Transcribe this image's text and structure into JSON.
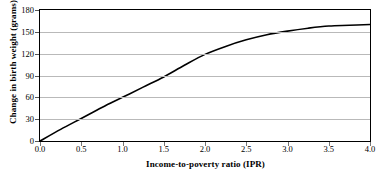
{
  "chart_data": {
    "type": "line",
    "title": "",
    "xlabel": "Income-to-poverty ratio (IPR)",
    "ylabel": "Change in birth weight (grams)",
    "xlim": [
      0.0,
      4.0
    ],
    "ylim": [
      0,
      180
    ],
    "xticks": [
      "0.0",
      "0.5",
      "1.0",
      "1.5",
      "2.0",
      "2.5",
      "3.0",
      "3.5",
      "4.0"
    ],
    "yticks": [
      "0",
      "30",
      "60",
      "90",
      "120",
      "150",
      "180"
    ],
    "grid": "horizontal",
    "legend": "none",
    "line_color": "#000000",
    "grid_color": "#b9b9b9",
    "series": [
      {
        "name": "Change in birth weight",
        "x": [
          0.0,
          0.25,
          0.5,
          0.75,
          1.0,
          1.25,
          1.5,
          1.75,
          2.0,
          2.25,
          2.5,
          2.75,
          3.0,
          3.25,
          3.5,
          3.75,
          4.0
        ],
        "values": [
          0,
          16,
          31,
          46,
          60,
          74,
          88,
          104,
          119,
          130,
          139,
          146,
          151,
          155,
          158,
          159,
          160
        ]
      }
    ]
  }
}
